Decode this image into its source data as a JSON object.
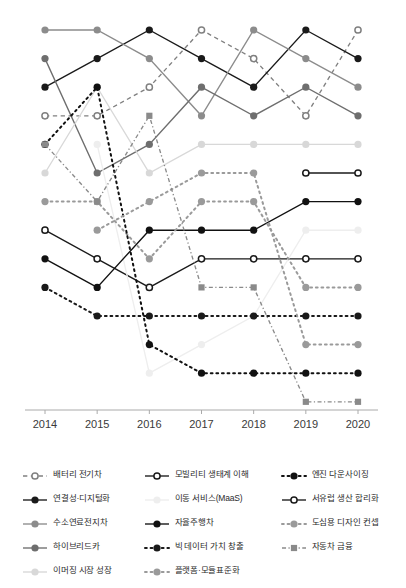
{
  "chart_data": {
    "type": "line",
    "title": "",
    "xlabel": "",
    "ylabel": "",
    "x": [
      2014,
      2015,
      2016,
      2017,
      2018,
      2019,
      2020
    ],
    "tick_labels": [
      "2014",
      "2015",
      "2016",
      "2017",
      "2018",
      "2019",
      "2020"
    ],
    "grid": false,
    "legend_position": "bottom",
    "ylim": [
      14.5,
      0.5
    ],
    "y_inverted": true,
    "note": "Bump / rank-trend chart: each series value is its rank position (1 = top row) per year. null = series not present that year.",
    "series": [
      {
        "name": "배터리 전기차",
        "color": "#808080",
        "line_style": "dashed",
        "marker": "open-circle",
        "values": [
          4,
          4,
          3,
          1,
          2,
          4,
          1
        ]
      },
      {
        "name": "연결성·디지털화",
        "color": "#1a1a1a",
        "line_style": "solid",
        "marker": "filled-circle",
        "values": [
          3,
          2,
          1,
          2,
          3,
          1,
          2
        ]
      },
      {
        "name": "수소연료전지차",
        "color": "#8c8c8c",
        "line_style": "solid",
        "marker": "filled-circle",
        "values": [
          1,
          1,
          2,
          4,
          1,
          2,
          3
        ]
      },
      {
        "name": "하이브리드카",
        "color": "#6e6e6e",
        "line_style": "solid",
        "marker": "filled-circle",
        "values": [
          2,
          6,
          5,
          3,
          4,
          3,
          4
        ]
      },
      {
        "name": "이머징 시장 성장",
        "color": "#d8d8d8",
        "line_style": "solid",
        "marker": "filled-circle",
        "values": [
          6,
          3,
          6,
          5,
          5,
          5,
          5
        ]
      },
      {
        "name": "모빌리티 생태계 이해",
        "color": "#1a1a1a",
        "line_style": "solid",
        "marker": "open-circle",
        "values": [
          8,
          9,
          10,
          9,
          9,
          9,
          9
        ]
      },
      {
        "name": "이동 서비스(MaaS)",
        "color": "#eeeeee",
        "line_style": "solid",
        "marker": "filled-circle",
        "values": [
          null,
          5,
          13,
          12,
          11,
          8,
          8
        ]
      },
      {
        "name": "자율주행차",
        "color": "#111111",
        "line_style": "solid",
        "marker": "filled-circle",
        "values": [
          9,
          10,
          8,
          8,
          8,
          7,
          7
        ]
      },
      {
        "name": "빅 데이터 가치 창출",
        "color": "#1a1a1a",
        "line_style": "dotted",
        "marker": "filled-circle",
        "values": [
          10,
          11,
          11,
          11,
          11,
          11,
          11
        ]
      },
      {
        "name": "플랫폼·모듈표준화",
        "color": "#9a9a9a",
        "line_style": "dotted",
        "marker": "filled-circle",
        "values": [
          7,
          7,
          9,
          7,
          7,
          10,
          10
        ]
      },
      {
        "name": "엔진 다운사이징",
        "color": "#111111",
        "line_style": "dotted",
        "marker": "filled-circle",
        "values": [
          5,
          3,
          12,
          13,
          13,
          13,
          13
        ]
      },
      {
        "name": "서유럽 생산 합리화",
        "color": "#1a1a1a",
        "line_style": "solid",
        "marker": "open-circle",
        "values": [
          null,
          null,
          null,
          null,
          null,
          6,
          6
        ]
      },
      {
        "name": "도심용 디자인 컨셉",
        "color": "#9a9a9a",
        "line_style": "dotted",
        "marker": "filled-circle",
        "values": [
          null,
          8,
          7,
          6,
          6,
          12,
          12
        ]
      },
      {
        "name": "자동차 금융",
        "color": "#8a8a8a",
        "line_style": "dash-dot",
        "marker": "filled-square",
        "values": [
          5,
          7,
          4,
          10,
          10,
          14,
          14
        ]
      }
    ]
  },
  "axis": {
    "tick_labels": [
      "2014",
      "2015",
      "2016",
      "2017",
      "2018",
      "2019",
      "2020"
    ],
    "label_color": "#3a3a3a"
  },
  "legend": {
    "columns": [
      {
        "items": [
          {
            "label": "배터리 전기차",
            "series": "배터리 전기차"
          },
          {
            "label": "연결성·디지털화",
            "series": "연결성·디지털화"
          },
          {
            "label": "수소연료전지차",
            "series": "수소연료전지차"
          },
          {
            "label": "하이브리드카",
            "series": "하이브리드카"
          },
          {
            "label": "이머징 시장 성장",
            "series": "이머징 시장 성장"
          }
        ]
      },
      {
        "items": [
          {
            "label": "모빌리티 생태계 이해",
            "series": "모빌리티 생태계 이해"
          },
          {
            "label": "이동 서비스(MaaS)",
            "series": "이동 서비스(MaaS)"
          },
          {
            "label": "자율주행차",
            "series": "자율주행차"
          },
          {
            "label": "빅 데이터 가치 창출",
            "series": "빅 데이터 가치 창출"
          },
          {
            "label": "플랫폼·모듈표준화",
            "series": "플랫폼·모듈표준화"
          }
        ]
      },
      {
        "items": [
          {
            "label": "엔진 다운사이징",
            "series": "엔진 다운사이징"
          },
          {
            "label": "서유럽 생산 합리화",
            "series": "서유럽 생산 합리화"
          },
          {
            "label": "도심용 디자인 컨셉",
            "series": "도심용 디자인 컨셉"
          },
          {
            "label": "자동차 금융",
            "series": "자동차 금융"
          }
        ]
      }
    ]
  }
}
